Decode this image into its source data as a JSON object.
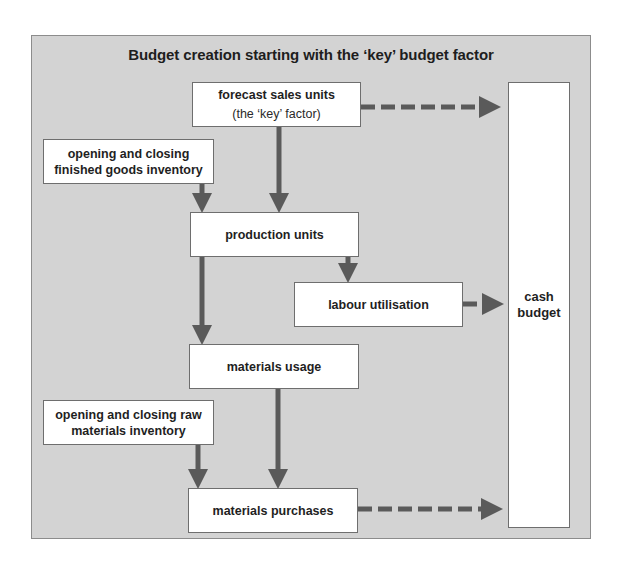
{
  "diagram": {
    "title": "Budget creation starting with the ‘key’ budget factor",
    "colors": {
      "panel_background": "#d3d3d3",
      "panel_border": "#8c8c8c",
      "node_background": "#ffffff",
      "arrow": "#5a5a5a",
      "text": "#1f1f1f"
    },
    "nodes": {
      "forecast": {
        "label": "forecast sales units",
        "sublabel": "(the ‘key’ factor)"
      },
      "finished_goods": {
        "label": "opening and closing finished goods inventory"
      },
      "production": {
        "label": "production units"
      },
      "labour": {
        "label": "labour utilisation"
      },
      "materials_usage": {
        "label": "materials usage"
      },
      "raw_materials": {
        "label": "opening and closing raw materials inventory"
      },
      "materials_purchases": {
        "label": "materials purchases"
      },
      "cash_budget": {
        "label": "cash budget"
      }
    },
    "edges": [
      {
        "from": "forecast",
        "to": "production",
        "style": "solid"
      },
      {
        "from": "finished_goods",
        "to": "production",
        "style": "solid"
      },
      {
        "from": "production",
        "to": "labour",
        "style": "solid"
      },
      {
        "from": "production",
        "to": "materials_usage",
        "style": "solid"
      },
      {
        "from": "materials_usage",
        "to": "materials_purchases",
        "style": "solid"
      },
      {
        "from": "raw_materials",
        "to": "materials_purchases",
        "style": "solid"
      },
      {
        "from": "forecast",
        "to": "cash_budget",
        "style": "dashed"
      },
      {
        "from": "labour",
        "to": "cash_budget",
        "style": "dashed"
      },
      {
        "from": "materials_purchases",
        "to": "cash_budget",
        "style": "dashed"
      }
    ]
  }
}
